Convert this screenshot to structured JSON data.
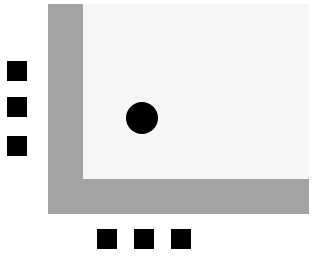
{
  "colors": {
    "background": "#ffffff",
    "frame": "#a3a3a3",
    "panel": "#f6f6f6",
    "marker": "#000000"
  },
  "diagram": {
    "frame": {
      "x": 48,
      "y": 4,
      "w": 261,
      "h": 210
    },
    "panel": {
      "x": 83,
      "y": 4,
      "w": 226,
      "h": 175
    },
    "dot": {
      "cx": 142,
      "cy": 118,
      "diameter": 32
    },
    "left_markers": [
      {
        "x": 7,
        "y": 61
      },
      {
        "x": 7,
        "y": 97
      },
      {
        "x": 7,
        "y": 136
      }
    ],
    "bottom_markers": [
      {
        "x": 97,
        "y": 229
      },
      {
        "x": 134,
        "y": 229
      },
      {
        "x": 171,
        "y": 229
      }
    ]
  }
}
